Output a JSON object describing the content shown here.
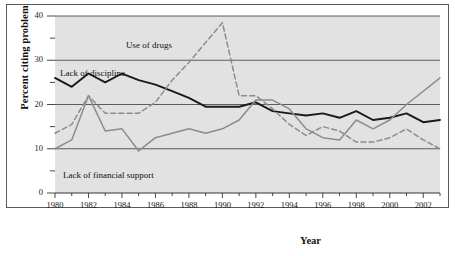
{
  "chart_data": {
    "type": "line",
    "title": "",
    "xlabel": "Year",
    "ylabel": "Percent citing problem",
    "xlim": [
      1980,
      2003
    ],
    "ylim": [
      0,
      40
    ],
    "grid": true,
    "legend_position": "inline-annotations",
    "x": [
      1980,
      1981,
      1982,
      1983,
      1984,
      1985,
      1986,
      1987,
      1988,
      1989,
      1990,
      1991,
      1992,
      1993,
      1994,
      1995,
      1996,
      1997,
      1998,
      1999,
      2000,
      2001,
      2002,
      2003
    ],
    "xticks": [
      "1980",
      "1982",
      "1984",
      "1986",
      "1988",
      "1990",
      "1992",
      "1994",
      "1996",
      "1998",
      "2000",
      "2002"
    ],
    "yticks": [
      "0",
      "10",
      "20",
      "30",
      "40"
    ],
    "yticks_minor": [
      5,
      15,
      25,
      35
    ],
    "series": [
      {
        "name": "Lack of discipline",
        "style": "solid",
        "color": "#1a1a1a",
        "values": [
          26.0,
          24.0,
          27.0,
          25.0,
          27.0,
          25.5,
          24.5,
          23.0,
          21.5,
          19.5,
          19.5,
          19.5,
          20.5,
          18.5,
          18.0,
          17.5,
          18.0,
          17.0,
          18.5,
          16.5,
          17.0,
          18.0,
          16.0,
          16.5
        ]
      },
      {
        "name": "Use of drugs",
        "style": "dashed",
        "color": "#8c8c8c",
        "values": [
          13.5,
          15.5,
          22.0,
          18.0,
          18.0,
          18.0,
          20.5,
          25.5,
          29.5,
          34.0,
          38.5,
          22.0,
          22.0,
          19.0,
          15.5,
          13.0,
          15.0,
          14.0,
          11.5,
          11.5,
          12.5,
          14.5,
          12.0,
          10.0
        ]
      },
      {
        "name": "Lack of financial support",
        "style": "solid",
        "color": "#8c8c8c",
        "values": [
          10.0,
          12.0,
          22.0,
          14.0,
          14.5,
          9.5,
          12.5,
          13.5,
          14.5,
          13.5,
          14.5,
          16.5,
          21.0,
          21.0,
          19.0,
          14.5,
          12.5,
          12.0,
          16.5,
          14.5,
          16.5,
          20.0,
          23.0,
          26.0
        ]
      }
    ],
    "annotations": [
      {
        "text": "Use of drugs",
        "x": 126,
        "y": 40
      },
      {
        "text": "Lack of discipline",
        "x": 60,
        "y": 68
      },
      {
        "text": "Lack of financial support",
        "x": 63,
        "y": 170
      }
    ]
  }
}
